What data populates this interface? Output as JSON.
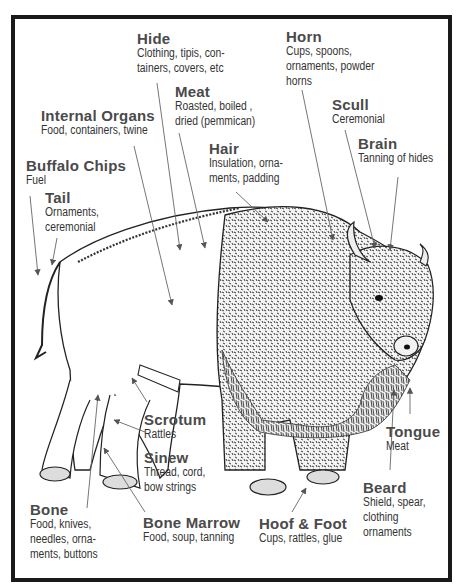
{
  "diagram": {
    "colors": {
      "border": "#1a1a1a",
      "label_title": "#4a4a4a",
      "label_text": "#333333",
      "pointer": "#555555"
    },
    "labels": [
      {
        "id": "hide",
        "title": "Hide",
        "lines": [
          "Clothing, tipis, con-",
          "tainers, covers, etc"
        ]
      },
      {
        "id": "horn",
        "title": "Horn",
        "lines": [
          "Cups, spoons,",
          "ornaments, powder",
          "horns"
        ]
      },
      {
        "id": "meat",
        "title": "Meat",
        "lines": [
          "Roasted, boiled ,",
          "dried (pemmican)"
        ]
      },
      {
        "id": "internal-organs",
        "title": "Internal Organs",
        "lines": [
          "Food, containers, twine"
        ]
      },
      {
        "id": "scull",
        "title": "Scull",
        "lines": [
          "Ceremonial"
        ]
      },
      {
        "id": "brain",
        "title": "Brain",
        "lines": [
          "Tanning of hides"
        ]
      },
      {
        "id": "hair",
        "title": "Hair",
        "lines": [
          "Insulation, orna-",
          "ments, padding"
        ]
      },
      {
        "id": "buffalo-chips",
        "title": "Buffalo Chips",
        "lines": [
          "Fuel"
        ]
      },
      {
        "id": "tail",
        "title": "Tail",
        "lines": [
          "Ornaments,",
          "ceremonial"
        ]
      },
      {
        "id": "scrotum",
        "title": "Scrotum",
        "lines": [
          "Rattles"
        ]
      },
      {
        "id": "sinew",
        "title": "Sinew",
        "lines": [
          "Thread, cord,",
          "bow strings"
        ]
      },
      {
        "id": "tongue",
        "title": "Tongue",
        "lines": [
          "Meat"
        ]
      },
      {
        "id": "beard",
        "title": "Beard",
        "lines": [
          "Shield, spear,",
          "clothing",
          "ornaments"
        ]
      },
      {
        "id": "bone",
        "title": "Bone",
        "lines": [
          "Food, knives,",
          "needles, orna-",
          "ments, buttons"
        ]
      },
      {
        "id": "bone-marrow",
        "title": "Bone Marrow",
        "lines": [
          "Food, soup, tanning"
        ]
      },
      {
        "id": "hoof-foot",
        "title": "Hoof & Foot",
        "lines": [
          "Cups, rattles, glue"
        ]
      }
    ]
  }
}
